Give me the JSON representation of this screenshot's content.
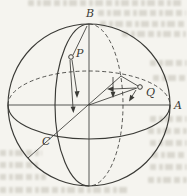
{
  "diagram": {
    "point_labels": {
      "B": "B",
      "A": "A",
      "C": "C",
      "P": "P",
      "Q": "Q"
    }
  },
  "colors": {
    "ink": "#3a3a36",
    "paper": "#f5f4ef",
    "bleed_text": "#c7c4ba"
  }
}
